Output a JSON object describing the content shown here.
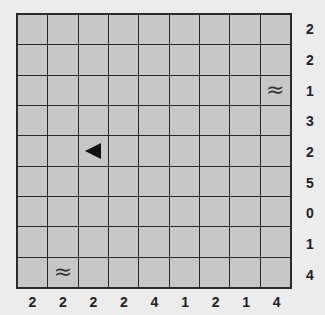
{
  "puzzle": {
    "type": "battleship",
    "rows": 9,
    "cols": 9,
    "row_clues": [
      "2",
      "2",
      "1",
      "3",
      "2",
      "5",
      "0",
      "1",
      "4"
    ],
    "col_clues": [
      "2",
      "2",
      "2",
      "2",
      "4",
      "1",
      "2",
      "1",
      "4"
    ],
    "given_cells": [
      {
        "row": 2,
        "col": 8,
        "icon": "water-icon",
        "glyph": "≈"
      },
      {
        "row": 4,
        "col": 2,
        "icon": "ship-end-left-icon",
        "glyph": "◀"
      },
      {
        "row": 8,
        "col": 1,
        "icon": "water-icon",
        "glyph": "≈"
      }
    ],
    "colors": {
      "background": "#ececec",
      "cell": "#c7c7c7",
      "grid_line": "#2a2a2a",
      "ship": "#111111"
    }
  }
}
